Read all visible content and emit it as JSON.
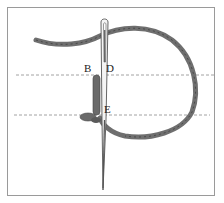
{
  "figure": {
    "labels": {
      "b": "B",
      "d": "D",
      "e": "E"
    },
    "colors": {
      "thread": "#6f6f6f",
      "thread_dark": "#4a4a4a",
      "needle": "#555555",
      "guide_line": "#8a8a8a",
      "frame": "#9a9a9a"
    }
  }
}
